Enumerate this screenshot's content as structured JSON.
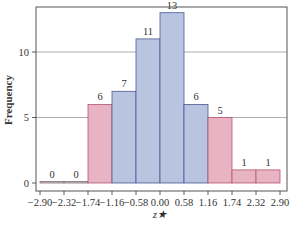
{
  "chart_data": {
    "type": "bar",
    "title": "",
    "xlabel": "z*",
    "ylabel": "Frequency",
    "bin_edges": [
      -2.9,
      -2.32,
      -1.74,
      -1.16,
      -0.58,
      0.0,
      0.58,
      1.16,
      1.74,
      2.32,
      2.9
    ],
    "x_tick_labels": [
      "-2.90",
      "-2.32",
      "-1.74",
      "-1.16",
      "-0.58",
      "0.00",
      "0.58",
      "1.16",
      "1.74",
      "2.32",
      "2.90"
    ],
    "categories": [
      "-2.90 to -2.32",
      "-2.32 to -1.74",
      "-1.74 to -1.16",
      "-1.16 to -0.58",
      "-0.58 to 0.00",
      "0.00 to 0.58",
      "0.58 to 1.16",
      "1.16 to 1.74",
      "1.74 to 2.32",
      "2.32 to 2.90"
    ],
    "values": [
      0,
      0,
      6,
      7,
      11,
      13,
      6,
      5,
      1,
      1
    ],
    "bar_labels": [
      "0",
      "0",
      "6",
      "7",
      "11",
      "13",
      "6",
      "5",
      "1",
      "1"
    ],
    "bar_colors": [
      "pink",
      "pink",
      "pink",
      "blue",
      "blue",
      "blue",
      "blue",
      "pink",
      "pink",
      "pink"
    ],
    "y_ticks": [
      0,
      5,
      10
    ],
    "y_tick_labels": [
      "0",
      "5",
      "10"
    ],
    "ylim": [
      0,
      13.5
    ],
    "xlim": [
      -2.9,
      2.9
    ],
    "grid": {
      "horizontal": true,
      "vertical": false,
      "lines_at": [
        5,
        10
      ]
    },
    "legend": null
  },
  "colors": {
    "pink_fill": "#e8b4c4",
    "pink_stroke": "#b4556f",
    "blue_fill": "#b8c4e0",
    "blue_stroke": "#4a5a92",
    "grid": "#999999",
    "axis": "#333333"
  },
  "labels": {
    "ylabel": "Frequency",
    "xlabel": "z★"
  }
}
